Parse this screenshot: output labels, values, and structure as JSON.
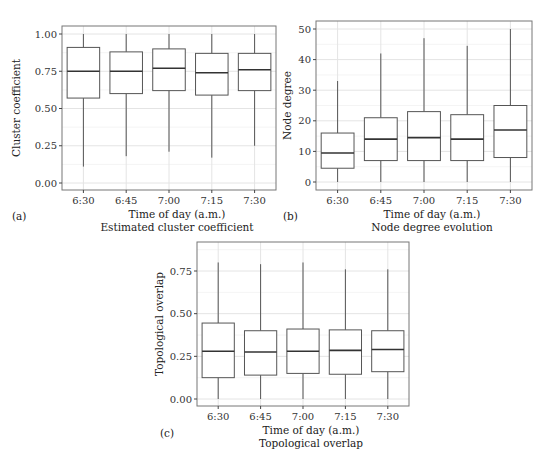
{
  "figure": {
    "width": 558,
    "height": 476,
    "colors": {
      "frame": "#777777",
      "grid_major": "#e4e4e4",
      "grid_minor": "#f1f1f1",
      "box_stroke": "#555555",
      "median": "#333333",
      "whisker": "#555555",
      "background": "#ffffff"
    }
  },
  "chart_data": [
    {
      "id": "a",
      "type": "boxplot",
      "panel_tag": "(a)",
      "title": "Estimated cluster coefficient",
      "xlabel": "Time of day (a.m.)",
      "ylabel": "Cluster coefficient",
      "categories": [
        "6:30",
        "6:45",
        "7:00",
        "7:15",
        "7:30"
      ],
      "yticks": [
        0.0,
        0.25,
        0.5,
        0.75,
        1.0
      ],
      "ytick_labels": [
        "0.00",
        "0.25",
        "0.50",
        "0.75",
        "1.00"
      ],
      "ylim": [
        -0.05,
        1.05
      ],
      "grid": true,
      "boxes": [
        {
          "label": "6:30",
          "whisker_low": 0.11,
          "q1": 0.57,
          "median": 0.75,
          "q3": 0.91,
          "whisker_high": 1.0
        },
        {
          "label": "6:45",
          "whisker_low": 0.18,
          "q1": 0.6,
          "median": 0.75,
          "q3": 0.88,
          "whisker_high": 1.0
        },
        {
          "label": "7:00",
          "whisker_low": 0.21,
          "q1": 0.62,
          "median": 0.77,
          "q3": 0.9,
          "whisker_high": 1.0
        },
        {
          "label": "7:15",
          "whisker_low": 0.17,
          "q1": 0.59,
          "median": 0.74,
          "q3": 0.87,
          "whisker_high": 1.0
        },
        {
          "label": "7:30",
          "whisker_low": 0.25,
          "q1": 0.62,
          "median": 0.76,
          "q3": 0.87,
          "whisker_high": 1.0
        }
      ]
    },
    {
      "id": "b",
      "type": "boxplot",
      "panel_tag": "(b)",
      "title": "Node degree evolution",
      "xlabel": "Time of day (a.m.)",
      "ylabel": "Node degree",
      "categories": [
        "6:30",
        "6:45",
        "7:00",
        "7:15",
        "7:30"
      ],
      "yticks": [
        0,
        10,
        20,
        30,
        40,
        50
      ],
      "ytick_labels": [
        "0",
        "10",
        "20",
        "30",
        "40",
        "50"
      ],
      "ylim": [
        -2.5,
        52.5
      ],
      "grid": true,
      "boxes": [
        {
          "label": "6:30",
          "whisker_low": 0,
          "q1": 4.5,
          "median": 9.5,
          "q3": 16,
          "whisker_high": 33
        },
        {
          "label": "6:45",
          "whisker_low": 0,
          "q1": 7,
          "median": 14,
          "q3": 21,
          "whisker_high": 42
        },
        {
          "label": "7:00",
          "whisker_low": 0,
          "q1": 7,
          "median": 14.5,
          "q3": 23,
          "whisker_high": 47
        },
        {
          "label": "7:15",
          "whisker_low": 0,
          "q1": 7,
          "median": 14,
          "q3": 22,
          "whisker_high": 44.5
        },
        {
          "label": "7:30",
          "whisker_low": 0,
          "q1": 8,
          "median": 17,
          "q3": 25,
          "whisker_high": 50
        }
      ]
    },
    {
      "id": "c",
      "type": "boxplot",
      "panel_tag": "(c)",
      "title": "Topological overlap",
      "xlabel": "Time of day (a.m.)",
      "ylabel": "Topological overlap",
      "categories": [
        "6:30",
        "6:45",
        "7:00",
        "7:15",
        "7:30"
      ],
      "yticks": [
        0.0,
        0.25,
        0.5,
        0.75
      ],
      "ytick_labels": [
        "0.00",
        "0.25",
        "0.50",
        "0.75"
      ],
      "ylim": [
        -0.04,
        0.88
      ],
      "grid": true,
      "boxes": [
        {
          "label": "6:30",
          "whisker_low": 0,
          "q1": 0.125,
          "median": 0.28,
          "q3": 0.445,
          "whisker_high": 0.8
        },
        {
          "label": "6:45",
          "whisker_low": 0,
          "q1": 0.14,
          "median": 0.275,
          "q3": 0.4,
          "whisker_high": 0.79
        },
        {
          "label": "7:00",
          "whisker_low": 0,
          "q1": 0.15,
          "median": 0.28,
          "q3": 0.41,
          "whisker_high": 0.8
        },
        {
          "label": "7:15",
          "whisker_low": 0,
          "q1": 0.145,
          "median": 0.285,
          "q3": 0.405,
          "whisker_high": 0.76
        },
        {
          "label": "7:30",
          "whisker_low": 0,
          "q1": 0.16,
          "median": 0.29,
          "q3": 0.4,
          "whisker_high": 0.76
        }
      ]
    }
  ]
}
